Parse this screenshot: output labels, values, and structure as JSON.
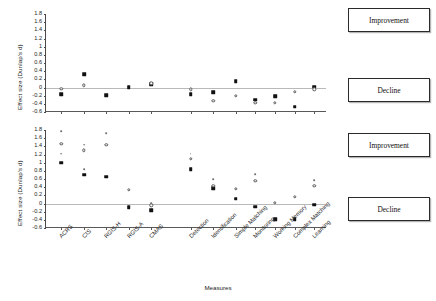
{
  "chart_data": {
    "type": "scatter",
    "title": "",
    "xlabel": "Measures",
    "ylabel": "Effect size (Dunlap's d)",
    "ylim": [
      -0.6,
      1.8
    ],
    "ytick_labels": [
      "1.8",
      "1.6",
      "1.4",
      "1.2",
      "1",
      "0.8",
      "0.6",
      "0.4",
      "0.2",
      "0",
      "-0.2",
      "-0.4",
      "-0.6"
    ],
    "ytick_values": [
      1.8,
      1.6,
      1.4,
      1.2,
      1.0,
      0.8,
      0.6,
      0.4,
      0.2,
      0,
      -0.2,
      -0.4,
      -0.6
    ],
    "grid": false,
    "zero_reference_line": 0,
    "categories": [
      "ACRS",
      "CIS",
      "RGIS-H",
      "RGIS-A",
      "CMAS",
      "Detection",
      "Identification",
      "Simple Matching",
      "Monitoring",
      "Working Memory",
      "Complex Matching",
      "Learning"
    ],
    "annotations": [
      {
        "text": "Improvement",
        "panel": "top"
      },
      {
        "text": "Decline",
        "panel": "top"
      },
      {
        "text": "Improvement",
        "panel": "bottom"
      },
      {
        "text": "Decline",
        "panel": "bottom"
      }
    ],
    "panels": [
      {
        "name": "top",
        "series": [
          {
            "name": "filled-square",
            "values": [
              -0.16,
              0.32,
              -0.19,
              0.01,
              0.08,
              -0.16,
              -0.11,
              0.15,
              -0.3,
              -0.22,
              -0.47,
              0.02
            ]
          },
          {
            "name": "open-circle",
            "values": [
              -0.03,
              0.05,
              null,
              null,
              0.1,
              -0.04,
              -0.33,
              -0.21,
              -0.38,
              -0.38,
              -0.1,
              -0.04
            ]
          }
        ]
      },
      {
        "name": "bottom",
        "series": [
          {
            "name": "filled-square",
            "values": [
              1.0,
              0.71,
              0.66,
              -0.09,
              -0.16,
              0.84,
              0.37,
              0.12,
              -0.08,
              -0.39,
              -0.39,
              -0.03
            ]
          },
          {
            "name": "open-circle",
            "values": [
              1.46,
              1.3,
              1.44,
              0.34,
              -0.04,
              1.1,
              0.44,
              0.36,
              0.56,
              0.02,
              0.17,
              0.43
            ]
          },
          {
            "name": "upper-dot",
            "values": [
              1.78,
              1.44,
              1.72,
              null,
              0.01,
              1.22,
              0.6,
              null,
              0.72,
              null,
              null,
              0.58
            ]
          },
          {
            "name": "lower-dot",
            "values": [
              1.22,
              0.84,
              null,
              null,
              null,
              null,
              null,
              null,
              null,
              null,
              null,
              null
            ]
          }
        ]
      }
    ]
  }
}
